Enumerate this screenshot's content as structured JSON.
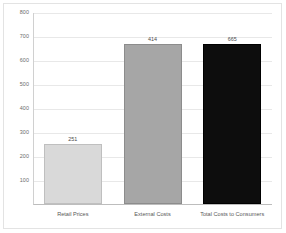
{
  "chart_data": {
    "type": "bar",
    "title": "",
    "subtitle": "",
    "xlabel": "",
    "ylabel": "",
    "categories": [
      "Retail Prices",
      "External Costs",
      "Total Costs to Consumers"
    ],
    "values": [
      251,
      414,
      665
    ],
    "data_labels": [
      "251",
      "414",
      "665"
    ],
    "bar_colors": [
      "#d9d9d9",
      "#a6a6a6",
      "#0d0d0d"
    ],
    "bar_border_colors": [
      "#bfbfbf",
      "#8c8c8c",
      "#000000"
    ],
    "bar_drawn_tops": [
      251,
      665,
      665
    ],
    "ylim": [
      0,
      800
    ],
    "ytick_values": [
      800,
      700,
      600,
      500,
      400,
      300,
      200,
      100
    ],
    "ytick_labels": [
      "800",
      "700",
      "600",
      "500",
      "400",
      "300",
      "200",
      "100"
    ],
    "grid": true,
    "grid_axis": "y",
    "legend": false,
    "legend_position": "none",
    "axis_line_color": "#bdbdbd",
    "gridline_color": "#e8e8e8",
    "background_color": "#ffffff",
    "frame_border_color": "#e3e3e3"
  }
}
